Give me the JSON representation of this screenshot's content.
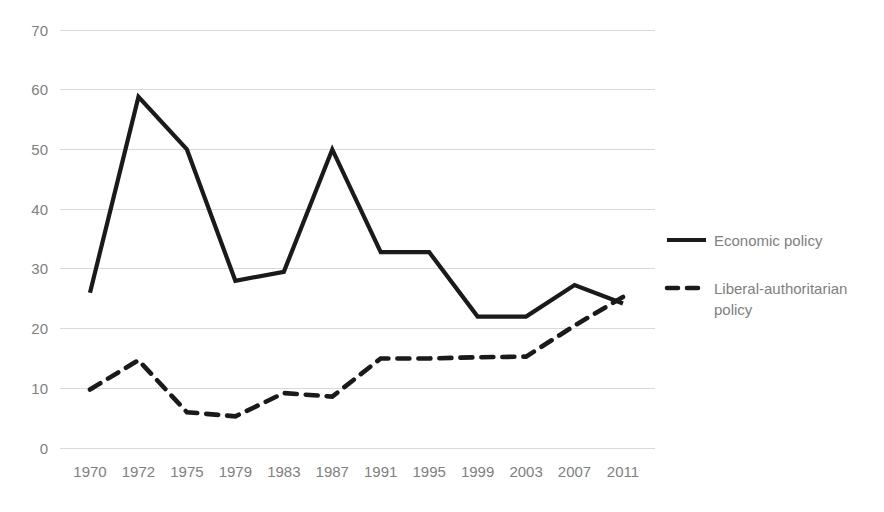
{
  "chart_data": {
    "type": "line",
    "title": "",
    "subtitle": "",
    "xlabel": "",
    "ylabel": "",
    "categories": [
      "1970",
      "1972",
      "1975",
      "1979",
      "1983",
      "1987",
      "1991",
      "1995",
      "1999",
      "2003",
      "2007",
      "2011"
    ],
    "x_tick_labels": [
      "1970",
      "1972",
      "1975",
      "1979",
      "1983",
      "1987",
      "1991",
      "1995",
      "1999",
      "2003",
      "2007",
      "2011"
    ],
    "y_tick_labels": [
      "0",
      "10",
      "20",
      "30",
      "40",
      "50",
      "60",
      "70"
    ],
    "y_ticks": [
      0,
      10,
      20,
      30,
      40,
      50,
      60,
      70
    ],
    "ylim": [
      0,
      70
    ],
    "grid": "horizontal",
    "legend_position": "right",
    "series": [
      {
        "name": "Economic policy",
        "style": "solid",
        "color": "#1a1a1a",
        "values": [
          26,
          58.8,
          50,
          28,
          29.5,
          50,
          32.8,
          32.8,
          22,
          22,
          27.3,
          24.2
        ]
      },
      {
        "name": "Liberal-authoritarian policy",
        "style": "dashed",
        "color": "#1a1a1a",
        "values": [
          9.8,
          14.7,
          6,
          5.3,
          9.2,
          8.6,
          15,
          15,
          15.2,
          15.3,
          20.5,
          25.3
        ]
      }
    ]
  },
  "legend": {
    "entries": [
      {
        "label": "Economic policy",
        "style": "solid"
      },
      {
        "label": "Liberal-authoritarian policy",
        "style": "dashed"
      }
    ]
  },
  "axes": {
    "y_axis_max_label": "70",
    "y_axis_min_label": "0"
  },
  "colors": {
    "line": "#1a1a1a",
    "gridline": "#d9d9d9",
    "tick_text": "#808080",
    "legend_text": "#808080",
    "background": "#ffffff"
  }
}
